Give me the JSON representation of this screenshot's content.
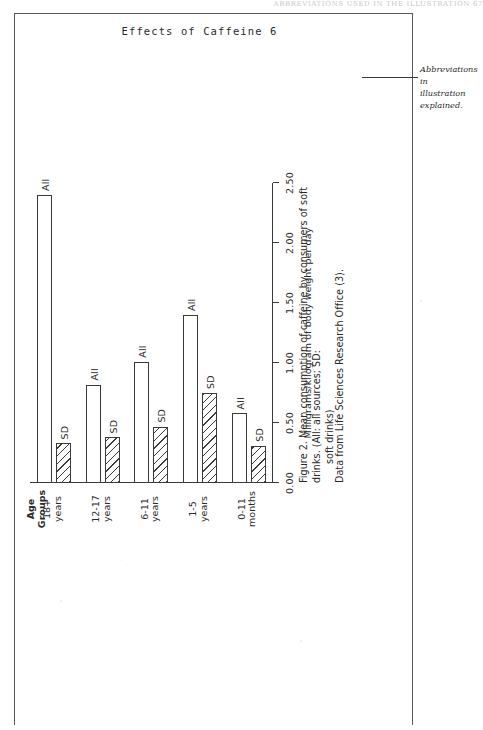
{
  "page": {
    "running_header": "Effects of Caffeine 6",
    "scan_bleed_text": "ABBREVIATIONS USED IN THE ILLUSTRATION   67"
  },
  "annotation": {
    "line1": "Abbreviations in",
    "line2": "illustration explained."
  },
  "caption": {
    "line1": "Figure 2. Mean consumption of caffeine by consumers of soft drinks. (All: all sources; SD:",
    "line2": "soft drinks)"
  },
  "source": {
    "text": "Data from Life Sciences Research Office (3)."
  },
  "chart_data": {
    "type": "bar",
    "title": "",
    "orientation": "vertical-bars-rotated-90",
    "xlabel": "Age Groups",
    "ylabel": "Milligrams/kilogram of body weight per day",
    "ylim": [
      0.0,
      2.5
    ],
    "yticks": [
      "0.00",
      "0.50",
      "1.00",
      "1.50",
      "2.00",
      "2.50"
    ],
    "ytick_values": [
      0.0,
      0.5,
      1.0,
      1.5,
      2.0,
      2.5
    ],
    "grid": false,
    "legend": "inline-bar-labels",
    "series_labels": {
      "all": "All",
      "sd": "SD"
    },
    "categories": [
      "0-11\nmonths",
      "1-5\nyears",
      "6-11\nyears",
      "12-17\nyears",
      "18+\nyears"
    ],
    "series": [
      {
        "name": "All",
        "values": [
          0.58,
          1.4,
          1.01,
          0.82,
          2.4
        ]
      },
      {
        "name": "SD",
        "values": [
          0.31,
          0.75,
          0.47,
          0.38,
          0.33
        ]
      }
    ]
  }
}
